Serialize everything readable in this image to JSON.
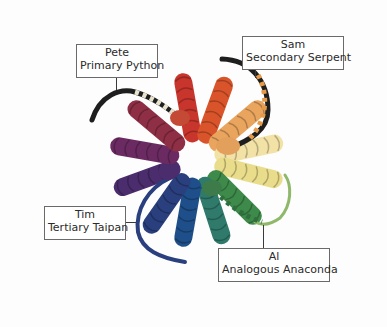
{
  "labels": {
    "pete": {
      "name": "Pete",
      "title": "Primary Python"
    },
    "sam": {
      "name": "Sam",
      "title": "Secondary Serpent"
    },
    "tim": {
      "name": "Tim",
      "title": "Tertiary Taipan"
    },
    "al": {
      "name": "Al",
      "title": "Analogous Anaconda"
    }
  },
  "skeins": [
    {
      "angle": -100,
      "color": "#c8352c"
    },
    {
      "angle": -70,
      "color": "#d9542a"
    },
    {
      "angle": -40,
      "color": "#e9a45e"
    },
    {
      "angle": -12,
      "color": "#f2e2a6"
    },
    {
      "angle": 14,
      "color": "#e9dc8a"
    },
    {
      "angle": 45,
      "color": "#3e8a4a"
    },
    {
      "angle": 72,
      "color": "#2f7a6a"
    },
    {
      "angle": 100,
      "color": "#1f4f8a"
    },
    {
      "angle": 125,
      "color": "#2a3f7d"
    },
    {
      "angle": 160,
      "color": "#4b2d6e"
    },
    {
      "angle": 190,
      "color": "#6b2b62"
    },
    {
      "angle": 220,
      "color": "#8e2f45"
    }
  ],
  "colors": {
    "background": "#fdfdfd",
    "label_border": "#6a6a6a",
    "label_text": "#2b2b2b"
  }
}
